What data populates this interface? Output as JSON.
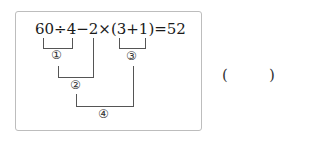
{
  "problem": {
    "expression": "60÷4−2×(3+1)=52",
    "step_labels": [
      "1",
      "2",
      "3",
      "4"
    ],
    "answer_blank": {
      "open": "(",
      "close": ")",
      "value": ""
    }
  }
}
